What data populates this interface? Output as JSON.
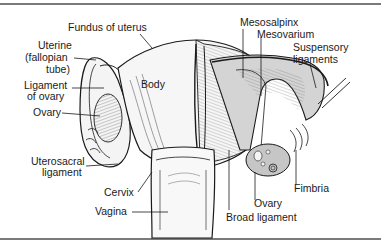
{
  "diagram": {
    "labels": {
      "fundus": "Fundus of uterus",
      "uterine_tube_1": "Uterine",
      "uterine_tube_2": "(fallopian",
      "uterine_tube_3": "tube)",
      "ligament_ovary_1": "Ligament",
      "ligament_ovary_2": "of ovary",
      "ovary_left": "Ovary",
      "body": "Body",
      "uterosacral_1": "Uterosacral",
      "uterosacral_2": "ligament",
      "cervix": "Cervix",
      "vagina": "Vagina",
      "mesosalpinx": "Mesosalpinx",
      "mesovarium": "Mesovarium",
      "suspensory_1": "Suspensory",
      "suspensory_2": "ligaments",
      "fimbria": "Fimbria",
      "ovary_right": "Ovary",
      "broad_ligament": "Broad ligament"
    },
    "colors": {
      "line": "#1a1a1a",
      "tissue_light": "#f2f2f2",
      "tissue_mid": "#cfcfcf",
      "tissue_dark": "#a8a8a8",
      "frame": "#7a7a7a"
    }
  }
}
